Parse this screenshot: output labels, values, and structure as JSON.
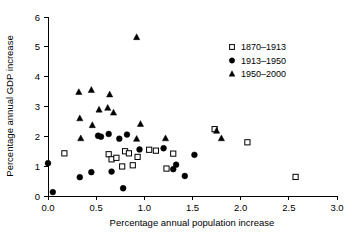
{
  "chart_data": {
    "type": "scatter",
    "title": "",
    "xlabel": "Percentage annual population increase",
    "ylabel": "Percentage annual GDP increase",
    "xlim": [
      0.0,
      3.0
    ],
    "ylim": [
      0,
      6
    ],
    "xticks": [
      "0.0",
      "0.5",
      "1.0",
      "1.5",
      "2.0",
      "2.5",
      "3.0"
    ],
    "xtick_values": [
      0.0,
      0.5,
      1.0,
      1.5,
      2.0,
      2.5,
      3.0
    ],
    "yticks": [
      "0",
      "1",
      "2",
      "3",
      "4",
      "5",
      "6"
    ],
    "ytick_values": [
      0,
      1,
      2,
      3,
      4,
      5,
      6
    ],
    "grid": false,
    "legend_position": "top-right",
    "series": [
      {
        "name": "1870-1913",
        "label": "1870–1913",
        "marker": "open-square",
        "color": "#000000",
        "points": [
          [
            0.17,
            1.43
          ],
          [
            0.63,
            1.4
          ],
          [
            0.66,
            1.23
          ],
          [
            0.71,
            1.28
          ],
          [
            0.77,
            0.99
          ],
          [
            0.8,
            1.5
          ],
          [
            0.84,
            1.43
          ],
          [
            0.88,
            1.03
          ],
          [
            0.93,
            1.31
          ],
          [
            1.05,
            1.55
          ],
          [
            1.12,
            1.52
          ],
          [
            1.23,
            0.92
          ],
          [
            1.3,
            1.42
          ],
          [
            1.73,
            2.24
          ],
          [
            2.07,
            1.8
          ],
          [
            2.57,
            0.64
          ]
        ]
      },
      {
        "name": "1913-1950",
        "label": "1913–1950",
        "marker": "filled-circle",
        "color": "#000000",
        "points": [
          [
            0.0,
            1.1
          ],
          [
            0.05,
            0.13
          ],
          [
            0.33,
            0.63
          ],
          [
            0.45,
            0.8
          ],
          [
            0.52,
            2.02
          ],
          [
            0.55,
            1.99
          ],
          [
            0.63,
            2.08
          ],
          [
            0.66,
            0.82
          ],
          [
            0.74,
            1.92
          ],
          [
            0.78,
            0.26
          ],
          [
            0.82,
            2.06
          ],
          [
            0.95,
            1.56
          ],
          [
            1.2,
            1.6
          ],
          [
            1.3,
            0.9
          ],
          [
            1.33,
            1.05
          ],
          [
            1.42,
            0.67
          ],
          [
            1.52,
            1.38
          ]
        ]
      },
      {
        "name": "1950-2000",
        "label": "1950–2000",
        "marker": "filled-triangle",
        "color": "#000000",
        "points": [
          [
            0.32,
            3.48
          ],
          [
            0.33,
            2.6
          ],
          [
            0.34,
            1.93
          ],
          [
            0.45,
            3.55
          ],
          [
            0.46,
            2.37
          ],
          [
            0.53,
            2.89
          ],
          [
            0.62,
            2.95
          ],
          [
            0.64,
            3.4
          ],
          [
            0.68,
            2.79
          ],
          [
            0.92,
            5.32
          ],
          [
            0.92,
            1.91
          ],
          [
            0.96,
            2.41
          ],
          [
            1.22,
            1.93
          ],
          [
            1.75,
            2.18
          ],
          [
            1.8,
            1.93
          ]
        ]
      }
    ]
  },
  "legend": {
    "entries": [
      {
        "label": "1870–1913",
        "marker": "open-square"
      },
      {
        "label": "1913–1950",
        "marker": "filled-circle"
      },
      {
        "label": "1950–2000",
        "marker": "filled-triangle"
      }
    ]
  }
}
